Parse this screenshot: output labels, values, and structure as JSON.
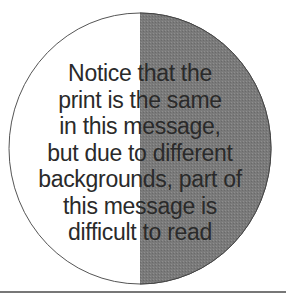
{
  "diagram": {
    "colors": {
      "left_half": "#ffffff",
      "right_half": "#7a7a7a",
      "outline": "#555555",
      "text": "#2a2a2a",
      "rule": "#777777"
    },
    "message_lines": [
      "Notice that the",
      "print is the same",
      "in this message,",
      "but due to different",
      "backgrounds, part of",
      "this message is",
      "difficult to read"
    ]
  }
}
